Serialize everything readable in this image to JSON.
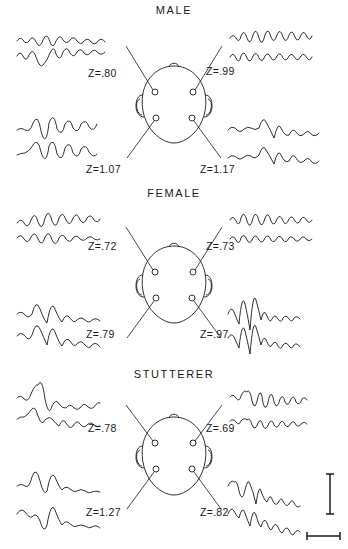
{
  "figure": {
    "type": "eeg-topographic-trace-figure",
    "panels": [
      {
        "id": "male",
        "title": "MALE",
        "labels": {
          "top_left": "Z=.80",
          "top_right": "Z=.99",
          "bottom_left": "Z=1.07",
          "bottom_right": "Z=1.17"
        },
        "sites": [
          {
            "position": "top-left",
            "z": 0.8,
            "traces": 2
          },
          {
            "position": "top-right",
            "z": 0.99,
            "traces": 2
          },
          {
            "position": "bottom-left",
            "z": 1.07,
            "traces": 2
          },
          {
            "position": "bottom-right",
            "z": 1.17,
            "traces": 2
          }
        ]
      },
      {
        "id": "female",
        "title": "FEMALE",
        "labels": {
          "top_left": "Z=.72",
          "top_right": "Z=.73",
          "bottom_left": "Z=.79",
          "bottom_right": "Z=.97"
        },
        "sites": [
          {
            "position": "top-left",
            "z": 0.72,
            "traces": 2
          },
          {
            "position": "top-right",
            "z": 0.73,
            "traces": 2
          },
          {
            "position": "bottom-left",
            "z": 0.79,
            "traces": 2
          },
          {
            "position": "bottom-right",
            "z": 0.97,
            "traces": 2
          }
        ]
      },
      {
        "id": "stutterer",
        "title": "STUTTERER",
        "labels": {
          "top_left": "Z=.78",
          "top_right": "Z=.69",
          "bottom_left": "Z=1.27",
          "bottom_right": "Z=.82"
        },
        "sites": [
          {
            "position": "top-left",
            "z": 0.78,
            "traces": 2
          },
          {
            "position": "top-right",
            "z": 0.69,
            "traces": 2
          },
          {
            "position": "bottom-left",
            "z": 1.27,
            "traces": 2
          },
          {
            "position": "bottom-right",
            "z": 0.82,
            "traces": 2
          }
        ]
      }
    ],
    "head_diagram": {
      "view": "superior",
      "nose_marker": "top",
      "ear_markers": [
        "left",
        "right"
      ],
      "electrodes": 4,
      "electrode_labels": []
    },
    "calibration": {
      "vertical_bar": "",
      "horizontal_bar": "",
      "label": ""
    },
    "colors": {
      "ink": "#1a1a1a",
      "background": "#ffffff"
    }
  }
}
